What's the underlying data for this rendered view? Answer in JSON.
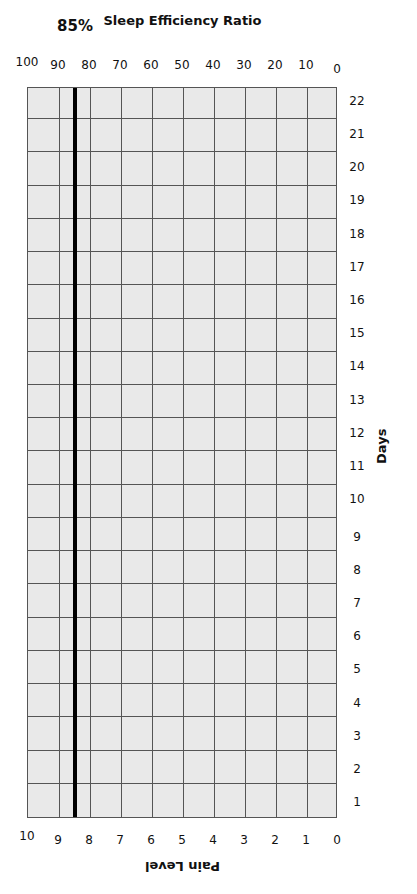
{
  "chart_data": {
    "type": "table",
    "title": "",
    "xlabel": "Days",
    "ylabel_left": "Pain Level",
    "ylabel_right": "Sleep Efficiency Ratio",
    "categories": [
      "1",
      "2",
      "3",
      "4",
      "5",
      "6",
      "7",
      "8",
      "9",
      "10",
      "11",
      "12",
      "13",
      "14",
      "15",
      "16",
      "17",
      "18",
      "19",
      "20",
      "21",
      "22"
    ],
    "left_ticks": [
      "0",
      "1",
      "2",
      "3",
      "4",
      "5",
      "6",
      "7",
      "8",
      "9",
      "10"
    ],
    "right_ticks": [
      "0",
      "10",
      "20",
      "30",
      "40",
      "50",
      "60",
      "70",
      "80",
      "90",
      "100"
    ],
    "ylim_left": [
      0,
      10
    ],
    "ylim_right": [
      0,
      100
    ],
    "reference_line": {
      "value_right": 85,
      "value_left": 8.5,
      "label": "85%"
    },
    "series": [],
    "grid": true,
    "orientation": "rotated -90deg"
  },
  "labels": {
    "xlabel": "Days",
    "left": "Pain Level",
    "right": "Sleep Efficiency Ratio",
    "ref": "85%"
  }
}
